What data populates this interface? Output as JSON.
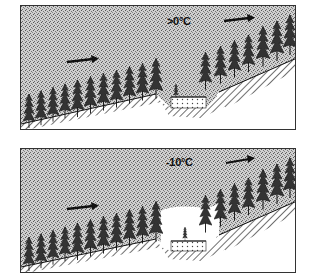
{
  "figure": {
    "panels": [
      {
        "id": "top",
        "temperature_label": ">0°C",
        "description": "Air above 0°C flows over forested slope; clearing/hollow not cold-filled",
        "wind_arrows": 2,
        "clearing_fill": "stippled air continuous"
      },
      {
        "id": "bottom",
        "temperature_label": "-10°C",
        "description": "Cold air at -10°C; clearing/hollow pooled with clear (cold) air",
        "wind_arrows": 2,
        "clearing_fill": "clear cold-air pool"
      }
    ],
    "colors": {
      "ink": "#111111",
      "stipple": "#9a9a9a",
      "paper": "#ffffff"
    }
  }
}
